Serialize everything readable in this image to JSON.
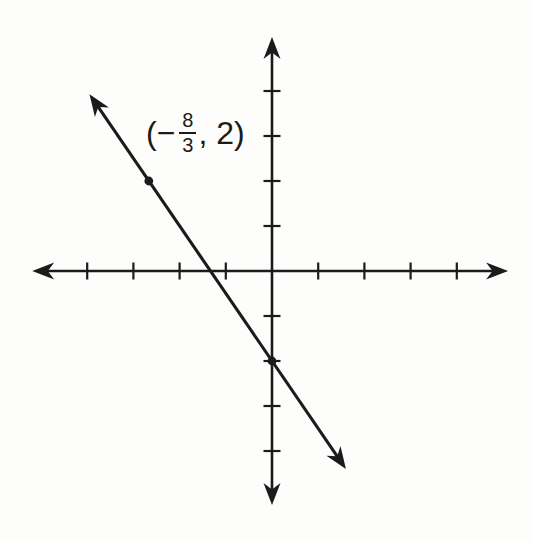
{
  "figure": {
    "background": "#fdfdfc",
    "ink_color": "#1b1b1b"
  },
  "point_label": {
    "open": "(−",
    "numerator": "8",
    "denominator": "3",
    "close": ", 2)"
  },
  "chart_data": {
    "type": "line",
    "title": "",
    "xlabel": "",
    "ylabel": "",
    "axes": {
      "xlim": [
        -5.19,
        5.11
      ],
      "ylim": [
        -5.2,
        5.2
      ],
      "x_ticks": [
        -4,
        -3,
        -2,
        -1,
        1,
        2,
        3,
        4
      ],
      "y_ticks": [
        -4,
        -3,
        -2,
        -1,
        1,
        2,
        3,
        4
      ],
      "tick_labels_shown": false,
      "grid": false,
      "axis_arrowheads": "both-ends"
    },
    "line": {
      "slope": -1.5,
      "y_intercept": -2,
      "x_intercept": -1.3333,
      "endpoints_units": [
        [
          -3.95,
          3.93
        ],
        [
          1.6,
          -4.4
        ]
      ],
      "arrowheads": "both"
    },
    "points": [
      {
        "x": -2.6667,
        "y": 2,
        "label": "(−8/3, 2)",
        "marked": true
      },
      {
        "x": 0,
        "y": -2,
        "label": "",
        "marked": true
      }
    ]
  }
}
